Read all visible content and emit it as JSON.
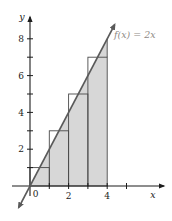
{
  "colors": {
    "background": "#ffffff",
    "shade": "#d7d7d7",
    "rect_stroke": "#4a4a4a",
    "line": "#5a5a5a",
    "axis": "#1c1c1c",
    "text": "#1c1c1c",
    "function_label_color": "#8f8a86"
  },
  "chart_data": {
    "type": "line",
    "title": "",
    "function_label": "f(x) = 2x",
    "function": {
      "slope": 2,
      "intercept": 0
    },
    "line_extent": {
      "x_start": -0.58,
      "x_end": 4.38
    },
    "shaded_region": {
      "description": "area under f(x) = 2x from x = 0 to x = 4",
      "vertices_units": [
        [
          0,
          0
        ],
        [
          4,
          0
        ],
        [
          4,
          8
        ]
      ]
    },
    "rectangles": [
      {
        "x0": 0,
        "x1": 1,
        "height": 1
      },
      {
        "x0": 1,
        "x1": 2,
        "height": 3
      },
      {
        "x0": 2,
        "x1": 3,
        "height": 5
      },
      {
        "x0": 3,
        "x1": 4,
        "height": 7
      }
    ],
    "xlabel": "x",
    "ylabel": "y",
    "origin_label": "0",
    "x_ticks": [
      1,
      2,
      3,
      4,
      5
    ],
    "x_tick_labels": [
      {
        "value": 2,
        "label": "2"
      },
      {
        "value": 4,
        "label": "4"
      }
    ],
    "y_ticks": [
      1,
      2,
      3,
      4,
      5,
      6,
      7,
      8
    ],
    "y_tick_labels": [
      {
        "value": 2,
        "label": "2"
      },
      {
        "value": 4,
        "label": "4"
      },
      {
        "value": 6,
        "label": "6"
      },
      {
        "value": 8,
        "label": "8"
      }
    ],
    "xlim": [
      -0.9,
      7.2
    ],
    "ylim": [
      -1.9,
      9.5
    ],
    "grid": "off",
    "legend": "none"
  }
}
